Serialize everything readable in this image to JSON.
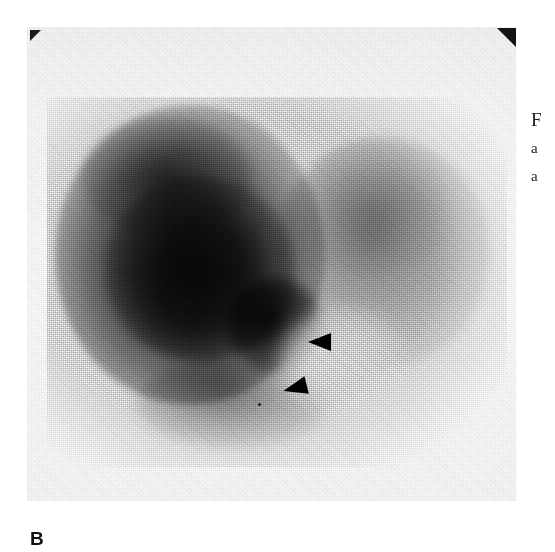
{
  "figure": {
    "panel_label": "B",
    "modality": "scintigraphy",
    "background_color": "#fbfbfb",
    "ink_color": "#1a1a1a"
  },
  "markers": {
    "corner_top_left": "corner-fiducial-marker",
    "corner_top_right": "corner-fiducial-marker",
    "arrowhead_upper": "arrowhead-pointer",
    "arrowhead_lower": "arrowhead-pointer",
    "arrowhead_color": "#000000",
    "arrowhead_count": 2
  },
  "caption": {
    "line_1": "F",
    "line_2": "a",
    "line_3": "a"
  }
}
